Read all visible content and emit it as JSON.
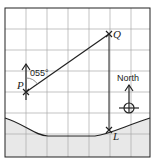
{
  "diagram": {
    "points": {
      "P": "P",
      "Q": "Q",
      "L": "L"
    },
    "bearing_label": "055°",
    "north_label": "North",
    "colors": {
      "grid": "#aaaaaa",
      "sea": "#e8e8e8",
      "line": "#222222"
    }
  }
}
